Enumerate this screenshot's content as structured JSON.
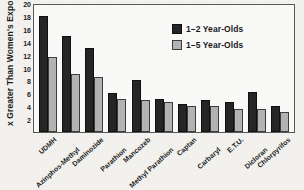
{
  "chart_data": {
    "type": "bar",
    "title": "",
    "xlabel": "",
    "ylabel": "x Greater Than Women's Exposure",
    "ylim": [
      0,
      20
    ],
    "yticks": [
      2,
      4,
      6,
      8,
      10,
      12,
      14,
      16,
      18,
      20
    ],
    "grid": false,
    "legend_position": "upper-right",
    "categories": [
      "UDMH",
      "Azinphos-Methyl",
      "Daminozide",
      "Parathion",
      "Mancozeb",
      "Methyl Parathion",
      "Captan",
      "Carbaryl",
      "E.T.U.",
      "Dicloran",
      "Chlorpyrifos"
    ],
    "series": [
      {
        "name": "1–2 Year-Olds",
        "color": "#262626",
        "values": [
          18.0,
          14.9,
          13.1,
          6.0,
          8.1,
          5.1,
          4.4,
          4.9,
          4.7,
          6.2,
          4.0
        ]
      },
      {
        "name": "1–5 Year-Olds",
        "color": "#b4b4b4",
        "values": [
          11.7,
          9.0,
          8.6,
          5.1,
          4.9,
          4.6,
          4.0,
          4.0,
          3.6,
          3.6,
          3.1
        ]
      }
    ]
  },
  "legend": {
    "entries": [
      {
        "label": "1–2 Year-Olds"
      },
      {
        "label": "1–5 Year-Olds"
      }
    ]
  }
}
